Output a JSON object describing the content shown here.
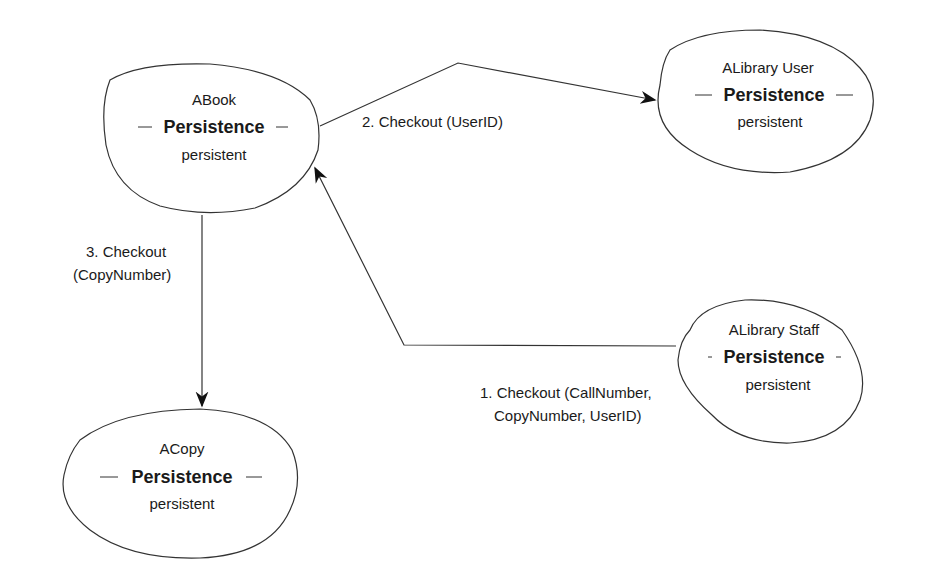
{
  "diagram": {
    "type": "collaboration",
    "objects": [
      {
        "id": "abook",
        "name": "ABook",
        "stereotype": "Persistence",
        "value": "persistent"
      },
      {
        "id": "alibrary_user",
        "name": "ALibrary User",
        "stereotype": "Persistence",
        "value": "persistent"
      },
      {
        "id": "alibrary_staff",
        "name": "ALibrary Staff",
        "stereotype": "Persistence",
        "value": "persistent"
      },
      {
        "id": "acopy",
        "name": "ACopy",
        "stereotype": "Persistence",
        "value": "persistent"
      }
    ],
    "messages": [
      {
        "from": "alibrary_staff",
        "to": "abook",
        "line1": "1. Checkout (CallNumber,",
        "line2": "CopyNumber, UserID)"
      },
      {
        "from": "abook",
        "to": "alibrary_user",
        "line1": "2. Checkout (UserID)"
      },
      {
        "from": "abook",
        "to": "acopy",
        "line1": "3. Checkout",
        "line2": "(CopyNumber)"
      }
    ]
  }
}
